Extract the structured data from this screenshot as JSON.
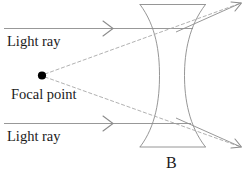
{
  "figure": {
    "panel_label": "B",
    "canvas": {
      "width": 242,
      "height": 181,
      "background": "#ffffff"
    }
  },
  "labels": {
    "light_ray_top": "Light ray",
    "light_ray_bottom": "Light ray",
    "focal_point": "Focal point"
  },
  "colors": {
    "text": "#1b1b1b",
    "ray_solid": "#8c8c8c",
    "ray_dashed": "#a8a8a8",
    "lens_outline": "#8a8a8a",
    "focal_dot": "#000000",
    "background": "#ffffff"
  },
  "geometry": {
    "focal_point": {
      "x": 42,
      "y": 75
    },
    "focal_dot_radius": 4.1,
    "lens": {
      "top_edge_y": 4,
      "bottom_edge_y": 147,
      "left_x": 140,
      "right_x": 205,
      "waist_left_x": 159,
      "waist_right_x": 184,
      "waist_y": 75
    },
    "incoming_rays": [
      {
        "name": "top",
        "x1": 4,
        "y1": 28,
        "x2": 192,
        "y2": 28,
        "arrow_x": 110
      },
      {
        "name": "bottom",
        "x1": 4,
        "y1": 123,
        "x2": 190,
        "y2": 123,
        "arrow_x": 110
      }
    ],
    "refracted_rays": [
      {
        "name": "upper-exit",
        "x1": 192,
        "y1": 26,
        "x2": 240,
        "y2": 4,
        "arrow": true
      },
      {
        "name": "lower-exit",
        "x1": 190,
        "y1": 124,
        "x2": 240,
        "y2": 146,
        "arrow": true
      }
    ],
    "virtual_rays_dashed": [
      {
        "name": "upper-virtual",
        "x1": 44,
        "y1": 74,
        "x2": 240,
        "y2": 4
      },
      {
        "name": "lower-virtual",
        "x1": 44,
        "y1": 77,
        "x2": 240,
        "y2": 146
      }
    ]
  }
}
